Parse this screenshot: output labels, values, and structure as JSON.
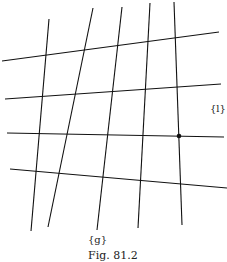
{
  "figure": {
    "caption": "Fig. 81.2",
    "labels": {
      "horizontal_family": "{l}",
      "vertical_family": "{g}"
    },
    "horizontal_lines": [
      {
        "x1": 2,
        "y1": 61,
        "x2": 219,
        "y2": 32
      },
      {
        "x1": 5,
        "y1": 99,
        "x2": 221,
        "y2": 84
      },
      {
        "x1": 7,
        "y1": 133,
        "x2": 224,
        "y2": 137
      },
      {
        "x1": 10,
        "y1": 169,
        "x2": 227,
        "y2": 188
      }
    ],
    "vertical_lines": [
      {
        "x1": 49,
        "y1": 19,
        "x2": 31,
        "y2": 231
      },
      {
        "x1": 93,
        "y1": 8,
        "x2": 48,
        "y2": 227
      },
      {
        "x1": 122,
        "y1": 7,
        "x2": 97,
        "y2": 230
      },
      {
        "x1": 150,
        "y1": 3,
        "x2": 138,
        "y2": 228
      },
      {
        "x1": 174,
        "y1": 2,
        "x2": 182,
        "y2": 225
      }
    ],
    "marked_point": {
      "x": 179,
      "y": 136
    },
    "line_color": "#111111"
  }
}
